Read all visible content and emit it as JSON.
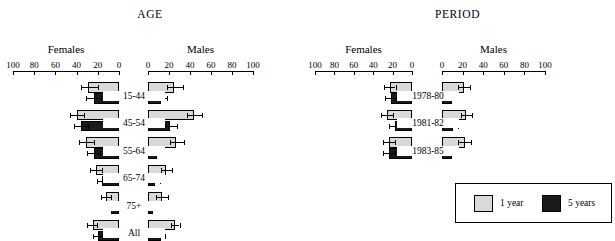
{
  "figure": {
    "legend": {
      "items": [
        {
          "label": "1 year",
          "color": "#d9d9d6"
        },
        {
          "label": "5 years",
          "color": "#1a1a1a"
        }
      ]
    }
  },
  "chart_data": [
    {
      "type": "bar",
      "title": "AGE",
      "orientation": "horizontal-bidirectional",
      "xlabel": "",
      "ylabel": "",
      "xlim": [
        0,
        100
      ],
      "grid": false,
      "legend_position": "outside-bottom-right",
      "panels": [
        {
          "name": "Females",
          "direction": "left"
        },
        {
          "name": "Males",
          "direction": "right"
        }
      ],
      "tick_labels": {
        "females": [
          "100",
          "80",
          "60",
          "40",
          "20",
          "0"
        ],
        "males": [
          "0",
          "20",
          "40",
          "60",
          "80",
          "100"
        ]
      },
      "tick_values": [
        0,
        20,
        40,
        60,
        80,
        100
      ],
      "categories": [
        "15-44",
        "45-54",
        "55-64",
        "65-74",
        "75+",
        "All"
      ],
      "series": [
        {
          "name": "1 year",
          "color": "#d9d9d6",
          "females": {
            "values": [
              29,
              40,
              31,
              22,
              12,
              25
            ],
            "err_low": [
              20,
              33,
              24,
              16,
              8,
              21
            ],
            "err_high": [
              36,
              46,
              38,
              27,
              17,
              30
            ]
          },
          "males": {
            "values": [
              25,
              44,
              27,
              17,
              13,
              26
            ],
            "err_low": [
              18,
              37,
              21,
              12,
              8,
              22
            ],
            "err_high": [
              33,
              51,
              34,
              23,
              19,
              30
            ]
          }
        },
        {
          "name": "5 years",
          "color": "#1a1a1a",
          "females": {
            "values": [
              24,
              36,
              24,
              16,
              8,
              20
            ],
            "err_low": [
              17,
              29,
              18,
              11,
              5,
              16
            ],
            "err_high": [
              31,
              42,
              30,
              21,
              13,
              25
            ]
          },
          "males": {
            "values": [
              12,
              21,
              9,
              7,
              5,
              12
            ],
            "err_low": [
              7,
              16,
              5,
              4,
              2,
              9
            ],
            "err_high": [
              18,
              28,
              14,
              11,
              9,
              16
            ]
          }
        }
      ]
    },
    {
      "type": "bar",
      "title": "PERIOD",
      "orientation": "horizontal-bidirectional",
      "xlabel": "",
      "ylabel": "",
      "xlim": [
        0,
        100
      ],
      "grid": false,
      "legend_position": "outside-bottom-right",
      "panels": [
        {
          "name": "Females",
          "direction": "left"
        },
        {
          "name": "Males",
          "direction": "right"
        }
      ],
      "tick_labels": {
        "females": [
          "100",
          "80",
          "60",
          "40",
          "20",
          "0"
        ],
        "males": [
          "0",
          "20",
          "40",
          "60",
          "80",
          "100"
        ]
      },
      "tick_values": [
        0,
        20,
        40,
        60,
        80,
        100
      ],
      "categories": [
        "1978-80",
        "1981-82",
        "1983-85"
      ],
      "series": [
        {
          "name": "1 year",
          "color": "#d9d9d6",
          "females": {
            "values": [
              23,
              26,
              24
            ],
            "err_low": [
              17,
              20,
              18
            ],
            "err_high": [
              29,
              32,
              30
            ]
          },
          "males": {
            "values": [
              21,
              23,
              22
            ],
            "err_low": [
              16,
              18,
              16
            ],
            "err_high": [
              27,
              29,
              28
            ]
          }
        },
        {
          "name": "5 years",
          "color": "#1a1a1a",
          "females": {
            "values": [
              22,
              18,
              24
            ],
            "err_low": [
              16,
              13,
              18
            ],
            "err_high": [
              28,
              24,
              30
            ]
          },
          "males": {
            "values": [
              10,
              11,
              10
            ],
            "err_low": [
              6,
              7,
              6
            ],
            "err_high": [
              15,
              16,
              15
            ]
          }
        }
      ]
    }
  ]
}
